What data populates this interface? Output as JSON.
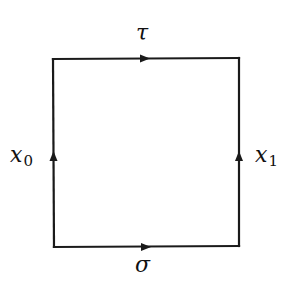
{
  "diagram": {
    "type": "commutative-square",
    "stroke_color": "#1a1a1a",
    "background": "#ffffff",
    "corners": {
      "top_left": [
        53,
        59
      ],
      "top_right": [
        239,
        58
      ],
      "bottom_left": [
        54,
        247
      ],
      "bottom_right": [
        239,
        246
      ]
    },
    "edges": [
      {
        "id": "top",
        "label": "τ",
        "direction": "left-to-right",
        "arrow_at": [
          145,
          58
        ]
      },
      {
        "id": "bottom",
        "label": "σ",
        "direction": "left-to-right",
        "arrow_at": [
          146,
          247
        ]
      },
      {
        "id": "left",
        "label_main": "x",
        "label_sub": "0",
        "direction": "bottom-to-top",
        "arrow_at": [
          53,
          156
        ]
      },
      {
        "id": "right",
        "label_main": "x",
        "label_sub": "1",
        "direction": "bottom-to-top",
        "arrow_at": [
          239,
          156
        ]
      }
    ]
  },
  "labels": {
    "tau": "τ",
    "sigma": "σ",
    "x0_main": "x",
    "x0_sub": "0",
    "x1_main": "x",
    "x1_sub": "1"
  }
}
